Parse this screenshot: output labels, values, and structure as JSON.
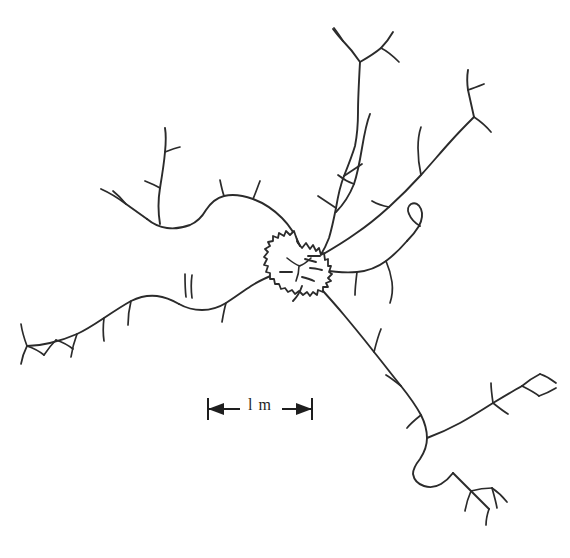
{
  "figure": {
    "kind": "hand-drawn trail network map",
    "background_color": "#ffffff",
    "ink_color": "#2b2b2b",
    "width_px": 570,
    "height_px": 558
  },
  "scale_bar": {
    "label": "l m",
    "value": 1,
    "unit": "m",
    "length_px": 106,
    "left_cap_x": 207,
    "right_cap_x": 313,
    "baseline_y": 409,
    "arrow_direction": "outward-double",
    "color": "#1e1e1e"
  },
  "nest": {
    "name": "central nest",
    "center_x": 298,
    "center_y": 265,
    "radius_px": 21,
    "style": "serrated circle",
    "spike_count": 26,
    "fill": "#ffffff",
    "stroke": "#2b2b2b"
  },
  "network": {
    "hub_x": 298,
    "hub_y": 265,
    "branch_count": 8,
    "branches": [
      {
        "id": "north-trunk",
        "label": "north trail",
        "direction": "north",
        "terminal_twigs": 3,
        "path": "M 320 270 C 326 250 330 232 333 214 C 336 196 340 178 346 160 C 351 144 355 128 358 112 C 360 96 360 78 360 62"
      },
      {
        "id": "north-fork",
        "label": "north fork",
        "direction": "north",
        "terminal_twigs": 2,
        "path": "M 360 62 C 356 54 350 46 340 38 M 360 62 C 368 58 376 54 384 48 C 388 44 390 38 392 32 M 384 48 C 390 50 396 54 402 60 M 340 38 C 336 34 332 30 328 26"
      },
      {
        "id": "northwest-loop",
        "label": "northwest looping trail",
        "direction": "northwest",
        "terminal_twigs": 4,
        "path": "M 306 244 C 300 230 292 218 282 208 C 270 196 256 190 242 188 C 228 186 216 192 208 200 C 200 208 192 214 182 216 C 172 218 162 216 154 212"
      },
      {
        "id": "west-upper",
        "label": "west upper branch",
        "direction": "west",
        "terminal_twigs": 3,
        "path": "M 154 212 C 146 208 138 202 130 196 C 122 190 114 186 104 184 M 154 212 C 150 200 150 188 152 176 C 154 164 160 152 166 140 C 168 134 168 132 166 128"
      },
      {
        "id": "west-long",
        "label": "west long trail",
        "direction": "west",
        "terminal_twigs": 5,
        "path": "M 276 280 C 262 288 248 294 234 296 C 220 298 206 300 194 306 C 180 312 166 320 152 328 C 138 336 124 342 110 346 C 96 350 82 352 68 352 C 54 352 40 350 28 346"
      },
      {
        "id": "east-upper",
        "label": "east upper trail",
        "direction": "northeast",
        "terminal_twigs": 3,
        "path": "M 322 258 C 338 250 352 242 366 232 C 380 222 394 210 408 198 C 422 186 434 174 446 160 C 456 148 466 136 476 124"
      },
      {
        "id": "east-mid",
        "label": "east middle branch",
        "direction": "east",
        "terminal_twigs": 2,
        "path": "M 320 272 C 334 276 348 278 362 278 C 376 278 388 274 398 266 C 406 260 414 252 420 244"
      },
      {
        "id": "southeast-long",
        "label": "southeast long trail",
        "direction": "southeast",
        "terminal_twigs": 6,
        "path": "M 316 284 C 328 296 340 308 352 322 C 364 336 376 350 388 364 C 398 376 408 388 418 400 C 426 410 432 420 436 430 C 440 442 444 454 450 464 C 456 474 464 484 472 492"
      }
    ]
  }
}
